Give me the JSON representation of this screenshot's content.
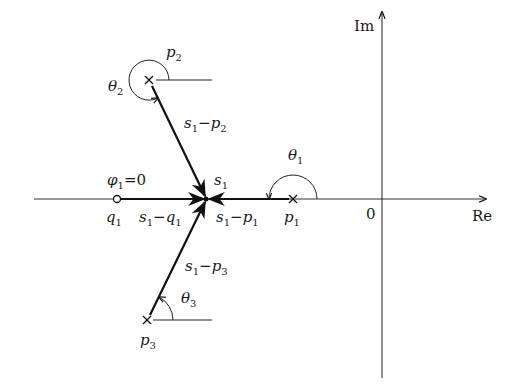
{
  "diagram": {
    "axes": {
      "real_label": "Re",
      "imag_label": "Im",
      "origin_label": "0"
    },
    "points": {
      "s1": {
        "name": "s",
        "sub": "1",
        "kind": "test-point"
      },
      "q1": {
        "name": "q",
        "sub": "1",
        "kind": "zero"
      },
      "p1": {
        "name": "p",
        "sub": "1",
        "kind": "pole"
      },
      "p2": {
        "name": "p",
        "sub": "2",
        "kind": "pole"
      },
      "p3": {
        "name": "p",
        "sub": "3",
        "kind": "pole"
      }
    },
    "vectors": {
      "s1_q1": {
        "a": "s",
        "as": "1",
        "op": "−",
        "b": "q",
        "bs": "1"
      },
      "s1_p1": {
        "a": "s",
        "as": "1",
        "op": "−",
        "b": "p",
        "bs": "1"
      },
      "s1_p2": {
        "a": "s",
        "as": "1",
        "op": "−",
        "b": "p",
        "bs": "2"
      },
      "s1_p3": {
        "a": "s",
        "as": "1",
        "op": "−",
        "b": "p",
        "bs": "3"
      }
    },
    "angles": {
      "phi1": {
        "sym": "φ",
        "sub": "1",
        "eq": "=0"
      },
      "theta1": {
        "sym": "θ",
        "sub": "1"
      },
      "theta2": {
        "sym": "θ",
        "sub": "2"
      },
      "theta3": {
        "sym": "θ",
        "sub": "3"
      }
    }
  }
}
